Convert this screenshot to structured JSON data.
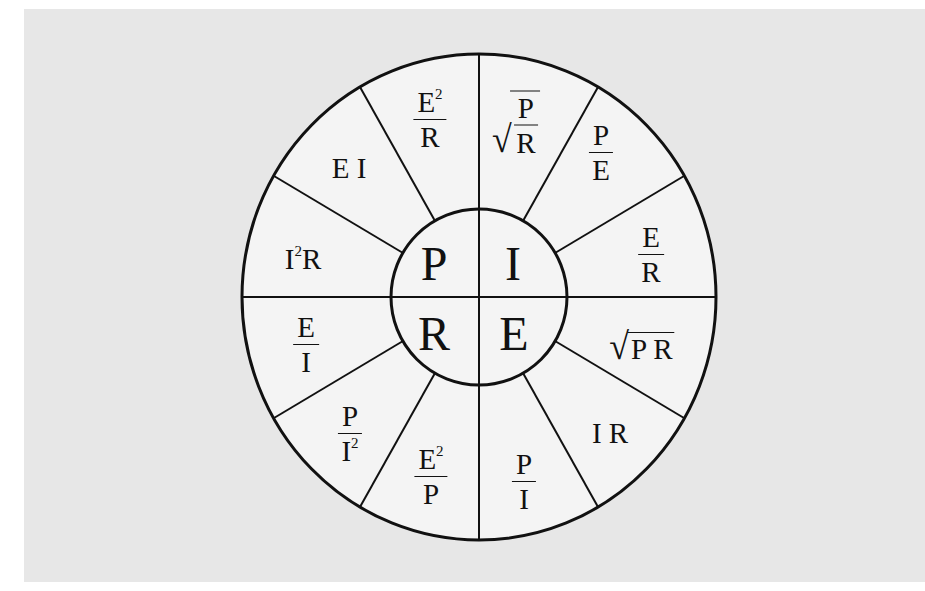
{
  "diagram": {
    "center_quadrants": [
      {
        "id": "P",
        "label": "P",
        "position": "top-left"
      },
      {
        "id": "I",
        "label": "I",
        "position": "top-right"
      },
      {
        "id": "R",
        "label": "R",
        "position": "bottom-left"
      },
      {
        "id": "E",
        "label": "E",
        "position": "bottom-right"
      }
    ],
    "formulas": {
      "P": [
        {
          "text": "E²/R",
          "num": "E",
          "num_sup": "2",
          "den": "R"
        },
        {
          "text": "EI",
          "value": "E I"
        },
        {
          "text": "I²R",
          "base": "I",
          "sup": "2",
          "rest": "R"
        }
      ],
      "I": [
        {
          "text": "√(P/R)",
          "num": "P",
          "den": "R"
        },
        {
          "text": "P/E",
          "num": "P",
          "den": "E"
        },
        {
          "text": "E/R",
          "num": "E",
          "den": "R"
        }
      ],
      "E": [
        {
          "text": "√(PR)",
          "value": "P R"
        },
        {
          "text": "IR",
          "value": "I R"
        },
        {
          "text": "P/I",
          "num": "P",
          "den": "I"
        }
      ],
      "R": [
        {
          "text": "E²/P",
          "num": "E",
          "num_sup": "2",
          "den": "P"
        },
        {
          "text": "P/I²",
          "num": "P",
          "den": "I",
          "den_sup": "2"
        },
        {
          "text": "E/I",
          "num": "E",
          "den": "I"
        }
      ]
    },
    "colors": {
      "background": "#e7e7e7",
      "wheel_fill": "#f4f4f4",
      "line": "#111111"
    }
  }
}
